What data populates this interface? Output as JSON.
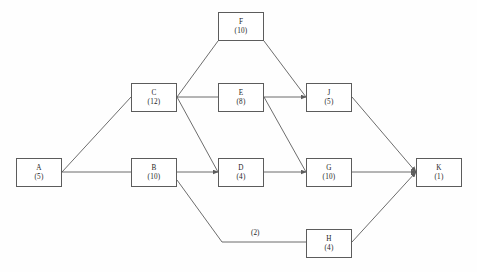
{
  "diagram": {
    "type": "activity-on-node-network",
    "title": "",
    "background_color": "#fefefe",
    "line_color": "#5c5c5c",
    "text_color": "#1d1d1d",
    "nodes": [
      {
        "id": "A",
        "name": "A",
        "duration_label": "(5)",
        "duration": 5,
        "x": 16,
        "y": 158,
        "w": 46,
        "h": 29
      },
      {
        "id": "B",
        "name": "B",
        "duration_label": "(10)",
        "duration": 10,
        "x": 131,
        "y": 158,
        "w": 46,
        "h": 29
      },
      {
        "id": "C",
        "name": "C",
        "duration_label": "(12)",
        "duration": 12,
        "x": 131,
        "y": 83,
        "w": 46,
        "h": 29
      },
      {
        "id": "D",
        "name": "D",
        "duration_label": "(4)",
        "duration": 4,
        "x": 218,
        "y": 158,
        "w": 46,
        "h": 29
      },
      {
        "id": "E",
        "name": "E",
        "duration_label": "(8)",
        "duration": 8,
        "x": 218,
        "y": 83,
        "w": 46,
        "h": 29
      },
      {
        "id": "F",
        "name": "F",
        "duration_label": "(10)",
        "duration": 10,
        "x": 218,
        "y": 12,
        "w": 46,
        "h": 29
      },
      {
        "id": "G",
        "name": "G",
        "duration_label": "(10)",
        "duration": 10,
        "x": 306,
        "y": 158,
        "w": 46,
        "h": 29
      },
      {
        "id": "H",
        "name": "H",
        "duration_label": "(4)",
        "duration": 4,
        "x": 306,
        "y": 229,
        "w": 46,
        "h": 29
      },
      {
        "id": "J",
        "name": "J",
        "duration_label": "(5)",
        "duration": 5,
        "x": 306,
        "y": 83,
        "w": 46,
        "h": 29
      },
      {
        "id": "K",
        "name": "K",
        "duration_label": "(1)",
        "duration": 1,
        "x": 416,
        "y": 158,
        "w": 46,
        "h": 29
      }
    ],
    "edges": [
      {
        "from": "A",
        "to": "C",
        "points": "62,172 131,97",
        "arrow": false,
        "label": ""
      },
      {
        "from": "A",
        "to": "B",
        "points": "62,172 131,172",
        "arrow": false,
        "label": ""
      },
      {
        "from": "C",
        "to": "F",
        "points": "177,97 218,41",
        "arrow": false,
        "label": ""
      },
      {
        "from": "C",
        "to": "E",
        "points": "177,97 218,97",
        "arrow": false,
        "label": ""
      },
      {
        "from": "C",
        "to": "D",
        "points": "177,97 218,172",
        "arrow": false,
        "label": ""
      },
      {
        "from": "B",
        "to": "D",
        "points": "177,172 218,172",
        "arrow": true,
        "label": ""
      },
      {
        "from": "B",
        "to": "H",
        "points": "177,180 222,242 306,242",
        "arrow": false,
        "label": "(2)"
      },
      {
        "from": "F",
        "to": "J",
        "points": "264,41 306,97",
        "arrow": false,
        "label": ""
      },
      {
        "from": "E",
        "to": "J",
        "points": "264,97 306,97",
        "arrow": true,
        "label": ""
      },
      {
        "from": "E",
        "to": "G",
        "points": "264,97 306,172",
        "arrow": false,
        "label": ""
      },
      {
        "from": "D",
        "to": "G",
        "points": "264,172 306,172",
        "arrow": true,
        "label": ""
      },
      {
        "from": "J",
        "to": "K",
        "points": "352,97 416,172",
        "arrow": true,
        "label": ""
      },
      {
        "from": "G",
        "to": "K",
        "points": "352,172 416,172",
        "arrow": true,
        "label": ""
      },
      {
        "from": "H",
        "to": "K",
        "points": "352,242 416,172",
        "arrow": true,
        "label": ""
      }
    ],
    "edge_labels": [
      {
        "text": "(2)",
        "x": 251,
        "y": 233
      }
    ]
  }
}
